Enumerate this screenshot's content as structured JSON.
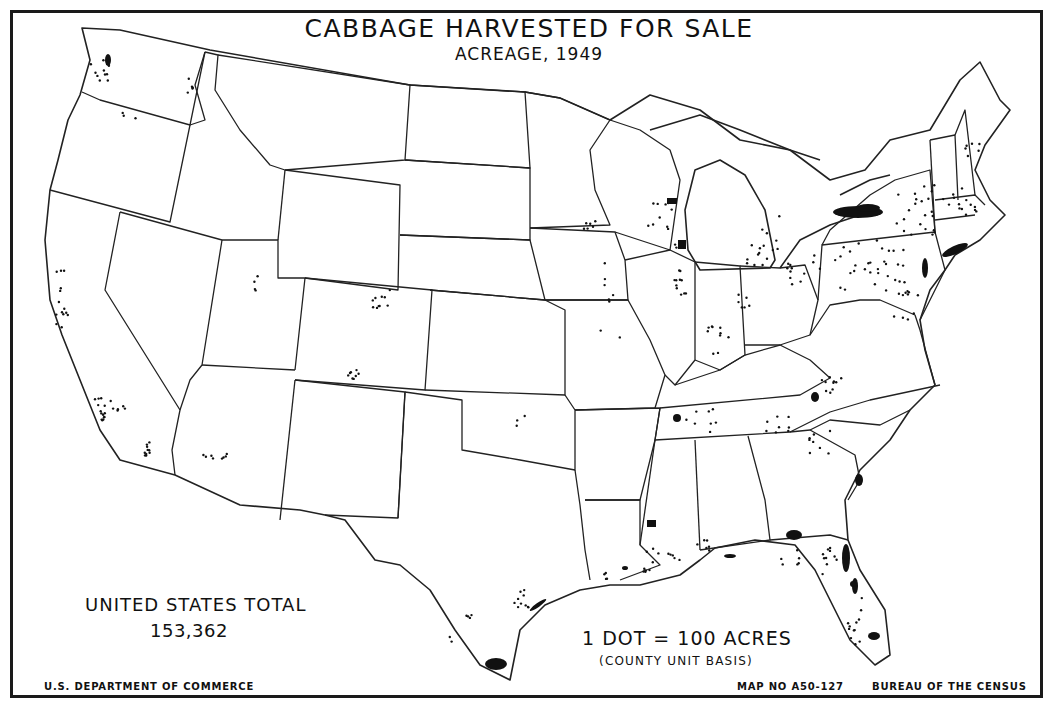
{
  "map": {
    "title": "CABBAGE HARVESTED FOR SALE",
    "subtitle": "ACREAGE, 1949",
    "total": {
      "label": "UNITED STATES TOTAL",
      "value": "153,362"
    },
    "legend": {
      "dot_value": "1 DOT = 100 ACRES",
      "basis": "(COUNTY UNIT BASIS)"
    },
    "footer": {
      "agency": "U.S. DEPARTMENT OF COMMERCE",
      "map_number": "MAP NO A50-127",
      "bureau": "BUREAU OF THE CENSUS"
    },
    "colors": {
      "ink": "#111111",
      "paper": "#ffffff"
    },
    "concentrations": [
      {
        "area": "Western New York",
        "density": "very high"
      },
      {
        "area": "Long Island / NYC area",
        "density": "high"
      },
      {
        "area": "Southern Wisconsin",
        "density": "high"
      },
      {
        "area": "Northeast Illinois (Chicago)",
        "density": "high"
      },
      {
        "area": "Lower Rio Grande Valley, Texas",
        "density": "very high"
      },
      {
        "area": "Northeast Florida (St. Johns)",
        "density": "high"
      },
      {
        "area": "South Florida",
        "density": "medium"
      },
      {
        "area": "Southwest Georgia",
        "density": "medium"
      },
      {
        "area": "Southwest Mississippi",
        "density": "medium"
      },
      {
        "area": "Coastal South Carolina",
        "density": "medium"
      },
      {
        "area": "Western North Carolina / SW Virginia",
        "density": "medium"
      },
      {
        "area": "West Tennessee",
        "density": "medium"
      },
      {
        "area": "Southern California",
        "density": "low"
      },
      {
        "area": "Colorado",
        "density": "low"
      }
    ]
  }
}
